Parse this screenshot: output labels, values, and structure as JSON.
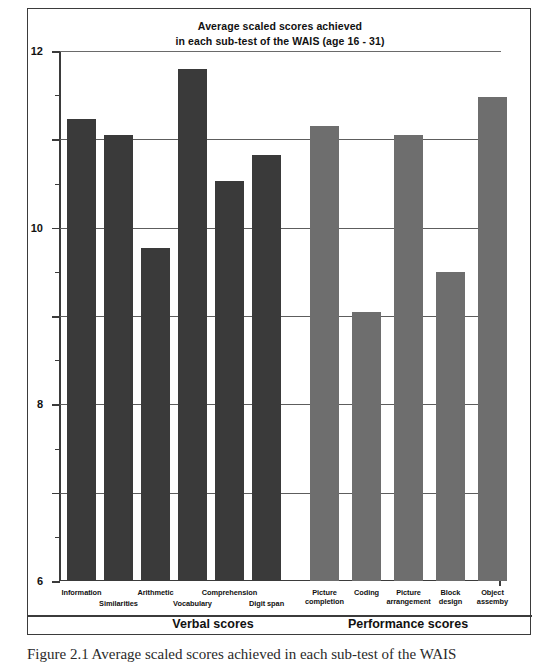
{
  "chart_data": {
    "type": "bar",
    "title": "Average scaled scores achieved in each sub-test of the WAIS (age 16 - 31)",
    "title_line1": "Average scaled scores achieved",
    "title_line2": "in each sub-test of the WAIS (age 16 - 31)",
    "xlabel": "",
    "ylabel": "",
    "ylim": [
      0,
      12
    ],
    "yticks": [
      0,
      2,
      4,
      6,
      8,
      10,
      12
    ],
    "ytick_labels": [
      "0",
      "2",
      "4",
      "6",
      "8",
      "10",
      "12"
    ],
    "minor_tick_step": 1,
    "grid": true,
    "legend": "none",
    "categories": [
      "Information",
      "Similarities",
      "Arithmetic",
      "Vocabulary",
      "Comprehension",
      "Digit span",
      "Picture completion",
      "Coding",
      "Picture arrangement",
      "Block design",
      "Object assembly"
    ],
    "values": [
      10.45,
      10.1,
      7.55,
      11.6,
      9.05,
      9.65,
      10.3,
      6.1,
      10.1,
      7.0,
      10.95
    ],
    "groups": [
      {
        "name": "Verbal scores",
        "color": "#3a3a3a",
        "categories": [
          "Information",
          "Similarities",
          "Arithmetic",
          "Vocabulary",
          "Comprehension",
          "Digit span"
        ],
        "values": [
          10.45,
          10.1,
          7.55,
          11.6,
          9.05,
          9.65
        ]
      },
      {
        "name": "Performance scores",
        "color": "#6e6e6e",
        "categories": [
          "Picture completion",
          "Coding",
          "Picture arrangement",
          "Block design",
          "Object assembly"
        ],
        "values": [
          10.3,
          6.1,
          10.1,
          7.0,
          10.95
        ]
      }
    ],
    "bars": [
      {
        "label": "Information",
        "label_lines": [
          "Information"
        ],
        "value": 10.45,
        "group": "verbal",
        "color": "#3a3a3a",
        "x": 8,
        "label_row": 0
      },
      {
        "label": "Similarities",
        "label_lines": [
          "Similarities"
        ],
        "value": 10.1,
        "group": "verbal",
        "color": "#3a3a3a",
        "x": 45,
        "label_row": 1
      },
      {
        "label": "Arithmetic",
        "label_lines": [
          "Arithmetic"
        ],
        "value": 7.55,
        "group": "verbal",
        "color": "#3a3a3a",
        "x": 82,
        "label_row": 0
      },
      {
        "label": "Vocabulary",
        "label_lines": [
          "Vocabulary"
        ],
        "value": 11.6,
        "group": "verbal",
        "color": "#3a3a3a",
        "x": 119,
        "label_row": 1
      },
      {
        "label": "Comprehension",
        "label_lines": [
          "Comprehension"
        ],
        "value": 9.05,
        "group": "verbal",
        "color": "#3a3a3a",
        "x": 156,
        "label_row": 0
      },
      {
        "label": "Digit span",
        "label_lines": [
          "Digit span"
        ],
        "value": 9.65,
        "group": "verbal",
        "color": "#3a3a3a",
        "x": 193,
        "label_row": 1
      },
      {
        "label": "Picture completion",
        "label_lines": [
          "Picture",
          "completion"
        ],
        "value": 10.3,
        "group": "performance",
        "color": "#6e6e6e",
        "x": 251,
        "label_row": 2
      },
      {
        "label": "Coding",
        "label_lines": [
          "Coding"
        ],
        "value": 6.1,
        "group": "performance",
        "color": "#6e6e6e",
        "x": 293,
        "label_row": 2
      },
      {
        "label": "Picture arrangement",
        "label_lines": [
          "Picture",
          "arrangement"
        ],
        "value": 10.1,
        "group": "performance",
        "color": "#6e6e6e",
        "x": 335,
        "label_row": 2
      },
      {
        "label": "Block design",
        "label_lines": [
          "Block",
          "design"
        ],
        "value": 7.0,
        "group": "performance",
        "color": "#6e6e6e",
        "x": 377,
        "label_row": 2
      },
      {
        "label": "Object assembly",
        "label_lines": [
          "Object",
          "assemby"
        ],
        "value": 10.95,
        "group": "performance",
        "color": "#6e6e6e",
        "x": 419,
        "label_row": 2
      }
    ]
  },
  "groups": {
    "verbal_label": "Verbal scores",
    "performance_label": "Performance scores"
  },
  "caption": {
    "text": "Figure 2.1 Average scaled scores achieved in each sub-test of the WAIS"
  },
  "colors": {
    "verbal_bar": "#3a3a3a",
    "performance_bar": "#6e6e6e",
    "axis": "#3b3b3b",
    "grid": "#5d5d5d",
    "background": "#ffffff"
  }
}
